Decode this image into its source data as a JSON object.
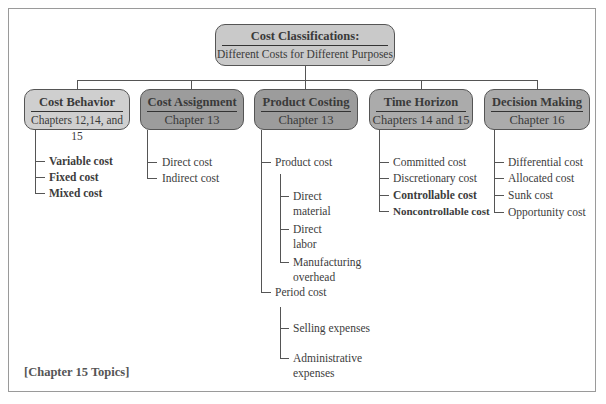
{
  "root": {
    "title": "Cost Classifications:",
    "subtitle": "Different Costs for Different Purposes",
    "color": "#c9c9c9"
  },
  "categories": [
    {
      "title": "Cost Behavior",
      "subtitle": "Chapters 12,14, and 15",
      "color": "#cfcfcf",
      "items": [
        {
          "label": "Variable cost",
          "chapter15": true
        },
        {
          "label": "Fixed cost",
          "chapter15": true
        },
        {
          "label": "Mixed cost",
          "chapter15": true
        }
      ]
    },
    {
      "title": "Cost Assignment",
      "subtitle": "Chapter 13",
      "color": "#9c9c9c",
      "items": [
        {
          "label": "Direct cost",
          "chapter15": false
        },
        {
          "label": "Indirect cost",
          "chapter15": false
        }
      ]
    },
    {
      "title": "Product Costing",
      "subtitle": "Chapter 13",
      "color": "#9c9c9c",
      "items": [
        {
          "label": "Product cost",
          "chapter15": false,
          "children": [
            {
              "label_line1": "Direct",
              "label_line2": "material"
            },
            {
              "label_line1": "Direct",
              "label_line2": "labor"
            },
            {
              "label_line1": "Manufacturing",
              "label_line2": "overhead"
            }
          ]
        },
        {
          "label": "Period cost",
          "chapter15": false,
          "children": [
            {
              "label_line1": "Selling expenses",
              "label_line2": ""
            },
            {
              "label_line1": "Administrative",
              "label_line2": "expenses"
            }
          ]
        }
      ]
    },
    {
      "title": "Time Horizon",
      "subtitle": "Chapters 14 and 15",
      "color": "#ababab",
      "items": [
        {
          "label": "Committed cost",
          "chapter15": false
        },
        {
          "label": "Discretionary cost",
          "chapter15": false
        },
        {
          "label": "Controllable cost",
          "chapter15": true
        },
        {
          "label": "Noncontrollable cost",
          "chapter15": true
        }
      ]
    },
    {
      "title": "Decision Making",
      "subtitle": "Chapter 16",
      "color": "#ababab",
      "items": [
        {
          "label": "Differential cost",
          "chapter15": false
        },
        {
          "label": "Allocated cost",
          "chapter15": false
        },
        {
          "label": "Sunk cost",
          "chapter15": false
        },
        {
          "label": "Opportunity cost",
          "chapter15": false
        }
      ]
    }
  ],
  "legend": "[Chapter 15 Topics]"
}
